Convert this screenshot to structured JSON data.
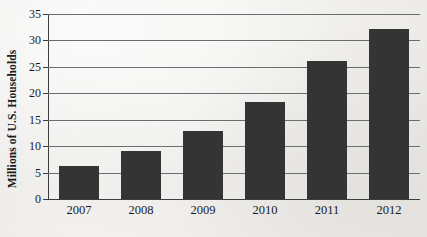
{
  "chart_data": {
    "type": "bar",
    "title": "",
    "subtitle": "",
    "xlabel": "",
    "ylabel": "Millions of U.S. Households",
    "categories": [
      "2007",
      "2008",
      "2009",
      "2010",
      "2011",
      "2012"
    ],
    "values": [
      6.3,
      9.0,
      12.9,
      18.3,
      26.2,
      32.2
    ],
    "series": [
      {
        "name": "Millions of U.S. Households",
        "values": [
          6.3,
          9.0,
          12.9,
          18.3,
          26.2,
          32.2
        ]
      }
    ],
    "ylim": [
      0,
      35
    ],
    "yticks": [
      0,
      5,
      10,
      15,
      20,
      25,
      30,
      35
    ],
    "ytick_labels": [
      "0",
      "5",
      "10",
      "15",
      "20",
      "25",
      "30",
      "35"
    ],
    "grid": "horizontal",
    "legend": "none",
    "bar_color": "#343434",
    "gridline_color": "#6d6d6d",
    "axis_color": "#3d3d3d",
    "background_color": "#f3f2f0"
  }
}
